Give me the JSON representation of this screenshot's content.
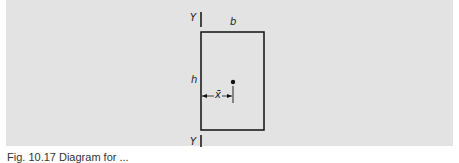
{
  "figure": {
    "labels": {
      "axis_top": "Y",
      "axis_bottom": "Y",
      "width": "b",
      "height": "h",
      "centroid_offset": "x̄"
    },
    "caption": "Fig. 10.17 Diagram for ..."
  }
}
